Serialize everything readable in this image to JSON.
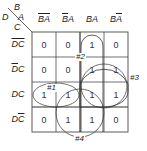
{
  "kmap": {
    "corner": {
      "top_var": "B",
      "left_var": "D",
      "col_var": "A",
      "row_var": "C"
    },
    "columns": [
      {
        "label": "B̄Ā",
        "parts": [
          {
            "t": "B",
            "bar": true
          },
          {
            "t": "A",
            "bar": true
          }
        ]
      },
      {
        "label": "B̄A",
        "parts": [
          {
            "t": "B",
            "bar": true
          },
          {
            "t": "A",
            "bar": false
          }
        ]
      },
      {
        "label": "BA",
        "parts": [
          {
            "t": "B",
            "bar": false
          },
          {
            "t": "A",
            "bar": false
          }
        ]
      },
      {
        "label": "BĀ",
        "parts": [
          {
            "t": "B",
            "bar": false
          },
          {
            "t": "A",
            "bar": true
          }
        ]
      }
    ],
    "rows": [
      {
        "label": "D̄C̄",
        "parts": [
          {
            "t": "D",
            "bar": true
          },
          {
            "t": "C",
            "bar": true
          }
        ],
        "values": [
          "0",
          "0",
          "1",
          "0"
        ]
      },
      {
        "label": "D̄C",
        "parts": [
          {
            "t": "D",
            "bar": true
          },
          {
            "t": "C",
            "bar": false
          }
        ],
        "values": [
          "0",
          "0",
          "1",
          "1"
        ]
      },
      {
        "label": "DC",
        "parts": [
          {
            "t": "D",
            "bar": false
          },
          {
            "t": "C",
            "bar": false
          }
        ],
        "values": [
          "1",
          "1",
          "1",
          "1"
        ]
      },
      {
        "label": "DC̄",
        "parts": [
          {
            "t": "D",
            "bar": false
          },
          {
            "t": "C",
            "bar": true
          }
        ],
        "values": [
          "0",
          "1",
          "1",
          "0"
        ]
      }
    ],
    "groups": [
      {
        "label": "#1",
        "cells": "row DC, all four columns"
      },
      {
        "label": "#2",
        "cells": "column BA, all four rows"
      },
      {
        "label": "#3",
        "cells": "D̄C/DC rows x BA/BĀ columns"
      },
      {
        "label": "#4",
        "cells": "DC/DC̄ rows x B̄A/BA columns"
      }
    ],
    "colors": {
      "line": "#333333",
      "background": "#ffffff"
    }
  }
}
